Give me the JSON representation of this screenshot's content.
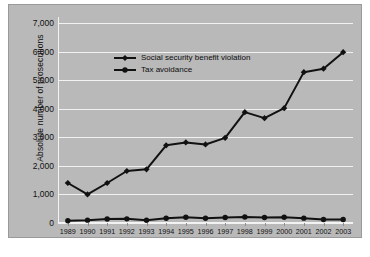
{
  "chart_data": {
    "type": "line",
    "title": "",
    "xlabel": "",
    "ylabel": "Absolute number of prosecutions",
    "categories": [
      "1989",
      "1990",
      "1991",
      "1992",
      "1993",
      "1994",
      "1995",
      "1996",
      "1997",
      "1998",
      "1999",
      "2000",
      "2001",
      "2002",
      "2003"
    ],
    "ylim": [
      0,
      7000
    ],
    "yticks": [
      0,
      1000,
      2000,
      3000,
      4000,
      5000,
      6000,
      7000
    ],
    "ytick_labels": [
      "0",
      "1,000",
      "2,000",
      "3,000",
      "4,000",
      "5,000",
      "6,000",
      "7,000"
    ],
    "grid": true,
    "legend_position": "upper-left-inside",
    "series": [
      {
        "name": "Social security benefit violation",
        "marker": "diamond",
        "color": "#111111",
        "values": [
          1400,
          1000,
          1400,
          1820,
          1880,
          2720,
          2820,
          2750,
          2980,
          3880,
          3670,
          4020,
          5280,
          5400,
          5980
        ]
      },
      {
        "name": "Tax avoidance",
        "marker": "circle",
        "color": "#111111",
        "values": [
          80,
          100,
          140,
          145,
          95,
          165,
          200,
          165,
          190,
          210,
          195,
          200,
          170,
          125,
          120
        ]
      }
    ]
  },
  "figure": {
    "background_color": "#b9b9b9",
    "gridline_color": "#f2f2f2",
    "border_color": "#9a9a9a"
  },
  "caption": {
    "text": ""
  }
}
